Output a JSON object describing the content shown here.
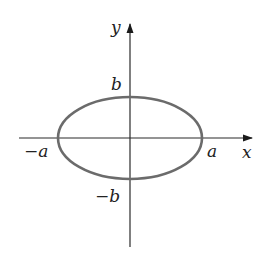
{
  "diagram": {
    "type": "ellipse-on-axes",
    "colors": {
      "axis": "#2a2a2a",
      "ellipse": "#6b6b6b",
      "text": "#222222",
      "background": "#ffffff"
    },
    "axes": {
      "x_label": "x",
      "y_label": "y"
    },
    "labels": {
      "pos_a": "a",
      "neg_a": "−a",
      "pos_b": "b",
      "neg_b": "−b"
    },
    "ellipse": {
      "cx": 130,
      "cy": 138,
      "rx": 72,
      "ry": 41
    }
  }
}
